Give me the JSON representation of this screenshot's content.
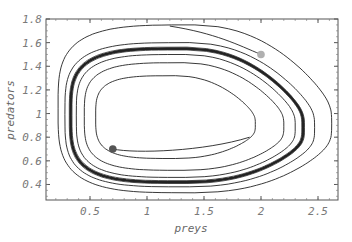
{
  "chart_data": {
    "type": "line",
    "title": "",
    "xlabel": "preys",
    "ylabel": "predators",
    "xlim": [
      0.16,
      2.7
    ],
    "ylim": [
      0.3,
      1.8
    ],
    "grid": false,
    "legend": null,
    "xticks": [
      0.5,
      1,
      1.5,
      2,
      2.5
    ],
    "xtick_labels": [
      "0.5",
      "1",
      "1.5",
      "2",
      "2.5"
    ],
    "yticks": [
      0.4,
      0.6,
      0.8,
      1,
      1.2,
      1.4,
      1.6,
      1.8
    ],
    "ytick_labels": [
      "0.4",
      "0.6",
      "0.8",
      "1",
      "1.2",
      "1.4",
      "1.6",
      "1.8"
    ],
    "start_points": [
      {
        "name": "outer-start",
        "x": 2.0,
        "y": 1.5,
        "color": "#b0b0b0"
      },
      {
        "name": "inner-start",
        "x": 0.7,
        "y": 0.7,
        "color": "#555555"
      }
    ],
    "limit_cycle": {
      "x_min": 0.33,
      "x_max": 2.37,
      "y_min": 0.42,
      "y_max": 1.55
    },
    "series": [
      {
        "name": "outer-trajectory-loop-1",
        "xmin": 0.22,
        "xmax": 2.62,
        "ymin": 0.33,
        "ymax": 1.75
      },
      {
        "name": "outer-trajectory-loop-2",
        "xmin": 0.28,
        "xmax": 2.47,
        "ymin": 0.38,
        "ymax": 1.6
      },
      {
        "name": "limit-cycle",
        "xmin": 0.33,
        "xmax": 2.37,
        "ymin": 0.42,
        "ymax": 1.55
      },
      {
        "name": "inner-trajectory-loop-2",
        "xmin": 0.38,
        "xmax": 2.3,
        "ymin": 0.46,
        "ymax": 1.5
      },
      {
        "name": "inner-trajectory-loop-1",
        "xmin": 0.45,
        "xmax": 2.2,
        "ymin": 0.52,
        "ymax": 1.43
      },
      {
        "name": "inner-trajectory-start",
        "xmin": 0.55,
        "xmax": 1.95,
        "ymin": 0.62,
        "ymax": 1.32
      }
    ]
  }
}
